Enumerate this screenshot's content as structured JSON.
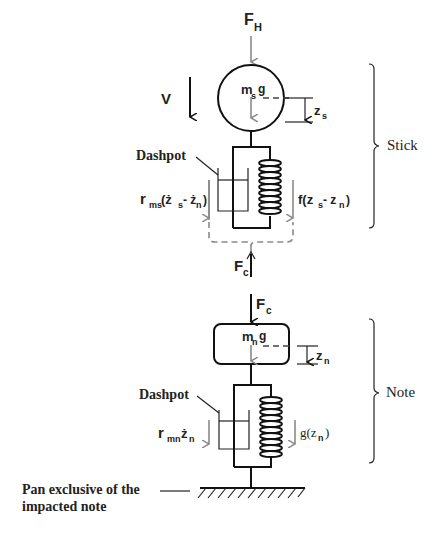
{
  "diagram": {
    "forces": {
      "hammer_force": {
        "main": "F",
        "sub": "H"
      },
      "contact_force_stick": {
        "main": "F",
        "sub": "c"
      },
      "contact_force_note": {
        "main": "F",
        "sub": "c"
      }
    },
    "velocity_label": "V",
    "stick": {
      "mass_label": {
        "m": "m",
        "sub": "s",
        "g": "g"
      },
      "displacement": {
        "main": "z",
        "sub": "s"
      },
      "dashpot_label": "Dashpot",
      "damping_force": {
        "r": "r",
        "rsub": "ms",
        "expr_open": "(ż",
        "s": "s",
        "minus": " - ż",
        "n": "n",
        "close": ")"
      },
      "spring_force": {
        "f": "f(z",
        "s": "s",
        "minus": " - z",
        "n": "n",
        "close": ")"
      },
      "group_label": "Stick"
    },
    "note": {
      "mass_label": {
        "m": "m",
        "sub": "n",
        "g": "g"
      },
      "displacement": {
        "main": "z",
        "sub": "n"
      },
      "dashpot_label": "Dashpot",
      "damping_force": {
        "r": "r",
        "rsub": "mn",
        "z": "ż",
        "n": "n"
      },
      "spring_force": {
        "g": "g(z",
        "n": "n",
        "close": ")"
      },
      "group_label": "Note"
    },
    "ground_label": {
      "line1": "Pan exclusive of the",
      "line2": "impacted note"
    },
    "colors": {
      "line": "#111111",
      "force_arrow": "#8a8a8a",
      "background": "#ffffff"
    }
  }
}
